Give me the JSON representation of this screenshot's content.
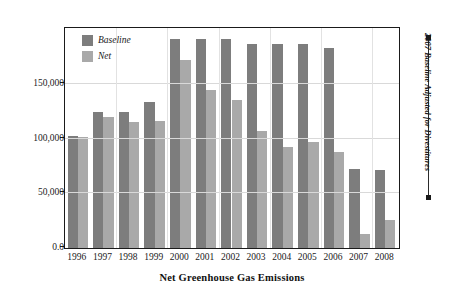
{
  "chart_data": {
    "type": "bar",
    "title": "Net Greenhouse Gas Emissions",
    "xlabel": "",
    "ylabel": "",
    "categories": [
      "1996",
      "1997",
      "1998",
      "1999",
      "2000",
      "2001",
      "2002",
      "2003",
      "2004",
      "2005",
      "2006",
      "2007",
      "2008"
    ],
    "series": [
      {
        "name": "Baseline",
        "color": "#7d7d7d",
        "values": [
          102000,
          124000,
          124000,
          133000,
          191000,
          191000,
          191000,
          186000,
          186000,
          186000,
          183000,
          72000,
          71000
        ]
      },
      {
        "name": "Net",
        "color": "#a9a9a9",
        "values": [
          101000,
          120000,
          115000,
          116000,
          172000,
          144000,
          135000,
          107000,
          92000,
          97000,
          88000,
          13000,
          26000
        ]
      }
    ],
    "ylim": [
      0,
      200000
    ],
    "yticks": [
      0,
      50000,
      100000,
      150000
    ],
    "ytick_labels": [
      "0.0",
      "50,000",
      "100,000",
      "150,000"
    ],
    "grid": true,
    "legend_position": "top-left",
    "annotations": [
      {
        "text": "2007 Baseline Adjusted for Divestitures",
        "position": "right-outside",
        "orientation": "vertical"
      }
    ]
  },
  "legend": {
    "items": [
      {
        "label": "Baseline"
      },
      {
        "label": "Net"
      }
    ]
  },
  "colors": {
    "baseline": "#7d7d7d",
    "net": "#a9a9a9",
    "frame": "#1a1a1a",
    "gridline": "#d9d9d9",
    "background": "#ffffff"
  }
}
